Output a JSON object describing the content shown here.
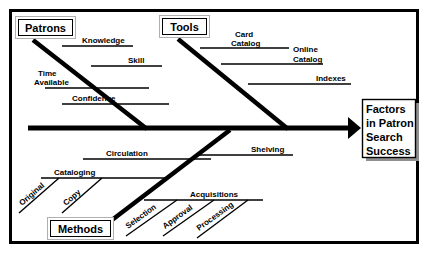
{
  "diagram": {
    "type": "fishbone-ishikawa",
    "title_text": "",
    "colors": {
      "background": "#ffffff",
      "ink": "#000000",
      "box_border": "#000000",
      "box_outer_border": "#b0b0b0",
      "shadow": "#9a9a9a"
    },
    "frame": {
      "x": 9,
      "y": 9,
      "width": 410,
      "height": 235,
      "stroke_width": 3
    },
    "spine": {
      "x1": 28,
      "y1": 128,
      "x2": 358,
      "y2": 128,
      "stroke_width": 5,
      "arrow": true
    },
    "effect": {
      "label": "Factors in Patron Search Success",
      "lines": [
        "Factors",
        "in Patron",
        "Search",
        "Success"
      ],
      "box": {
        "x": 362,
        "y": 100,
        "width": 55,
        "height": 58
      }
    },
    "categories": [
      {
        "id": "patrons",
        "label": "Patrons",
        "position": "top-left",
        "box": {
          "x": 18,
          "y": 19,
          "width": 54,
          "height": 17
        },
        "spine": {
          "x1": 33,
          "y1": 40,
          "x2": 145,
          "y2": 128
        },
        "bones": [
          {
            "label": "Knowledge",
            "line": {
              "x1": 62,
              "y1": 46,
              "x2": 132,
              "y2": 46
            },
            "label_x": 82,
            "label_y": 43,
            "anchor": "start"
          },
          {
            "label": "Skill",
            "line": {
              "x1": 91,
              "y1": 66,
              "x2": 161,
              "y2": 66
            },
            "label_x": 128,
            "label_y": 63,
            "anchor": "start"
          },
          {
            "label": "Time Available",
            "label_lines": [
              "Time",
              "Available"
            ],
            "line": {
              "x1": 44,
              "y1": 88,
              "x2": 148,
              "y2": 88
            },
            "label_x": 38,
            "label_y": 76,
            "anchor": "start"
          },
          {
            "label": "Confidence",
            "line": {
              "x1": 62,
              "y1": 104,
              "x2": 168,
              "y2": 104
            },
            "label_x": 72,
            "label_y": 101,
            "anchor": "start"
          }
        ],
        "subbones": []
      },
      {
        "id": "tools",
        "label": "Tools",
        "position": "top-right",
        "box": {
          "x": 162,
          "y": 18,
          "width": 44,
          "height": 17
        },
        "spine": {
          "x1": 178,
          "y1": 39,
          "x2": 285,
          "y2": 128
        },
        "bones": [
          {
            "label": "Card Catalog",
            "label_lines": [
              "Card",
              "Catalog"
            ],
            "line": {
              "x1": 200,
              "y1": 48,
              "x2": 288,
              "y2": 48
            },
            "label_x": 234,
            "label_y": 36,
            "anchor": "start"
          },
          {
            "label": "Online Catalog",
            "label_lines": [
              "Online",
              "Catalog"
            ],
            "line": {
              "x1": 221,
              "y1": 64,
              "x2": 322,
              "y2": 64
            },
            "label_x": 290,
            "label_y": 52,
            "anchor": "start"
          },
          {
            "label": "Indexes",
            "line": {
              "x1": 248,
              "y1": 84,
              "x2": 350,
              "y2": 84
            },
            "label_x": 316,
            "label_y": 81,
            "anchor": "start"
          }
        ],
        "subbones": []
      },
      {
        "id": "methods",
        "label": "Methods",
        "position": "bottom-left",
        "box": {
          "x": 50,
          "y": 220,
          "width": 60,
          "height": 17
        },
        "spine": {
          "x1": 112,
          "y1": 219,
          "x2": 228,
          "y2": 131
        },
        "bones": [
          {
            "label": "Circulation",
            "line": {
              "x1": 83,
              "y1": 159,
              "x2": 210,
              "y2": 159
            },
            "label_x": 106,
            "label_y": 156,
            "anchor": "start"
          },
          {
            "label": "Cataloging",
            "line": {
              "x1": 41,
              "y1": 178,
              "x2": 168,
              "y2": 178
            },
            "label_x": 54,
            "label_y": 175,
            "anchor": "start"
          },
          {
            "label": "Acquisitions",
            "line": {
              "x1": 144,
              "y1": 200,
              "x2": 262,
              "y2": 200
            },
            "label_x": 190,
            "label_y": 197,
            "anchor": "start"
          },
          {
            "label": "Shelving",
            "line": {
              "x1": 196,
              "y1": 155,
              "x2": 292,
              "y2": 155
            },
            "label_x": 250,
            "label_y": 152,
            "anchor": "start"
          }
        ],
        "subbones": [
          {
            "label": "Original",
            "line": {
              "x1": 19,
              "y1": 212,
              "x2": 58,
              "y2": 178
            },
            "label_x": 22,
            "label_y": 205,
            "rotate": -41
          },
          {
            "label": "Copy",
            "line": {
              "x1": 62,
              "y1": 212,
              "x2": 101,
              "y2": 178
            },
            "label_x": 65,
            "label_y": 205,
            "rotate": -41
          },
          {
            "label": "Selection",
            "line": {
              "x1": 126,
              "y1": 235,
              "x2": 176,
              "y2": 200
            },
            "label_x": 127,
            "label_y": 227,
            "rotate": -36
          },
          {
            "label": "Approval",
            "line": {
              "x1": 163,
              "y1": 235,
              "x2": 213,
              "y2": 200
            },
            "label_x": 164,
            "label_y": 227,
            "rotate": -36
          },
          {
            "label": "Processing",
            "line": {
              "x1": 197,
              "y1": 237,
              "x2": 247,
              "y2": 200
            },
            "label_x": 198,
            "label_y": 229,
            "rotate": -36
          }
        ]
      }
    ]
  }
}
